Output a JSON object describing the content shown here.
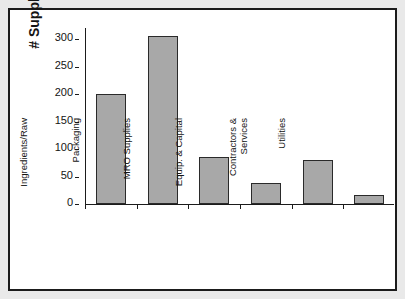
{
  "chart_data": {
    "type": "bar",
    "title": "",
    "xlabel": "",
    "ylabel": "# Suppliers",
    "ylim": [
      0,
      320
    ],
    "yticks": [
      0,
      50,
      100,
      150,
      200,
      250,
      300
    ],
    "ytick_labels": [
      "0",
      "50",
      "100",
      "150",
      "200",
      "250",
      "300"
    ],
    "grid": false,
    "legend": "none",
    "bar_color": "#a8a8a8",
    "bar_edge_color": "#2a2a2a",
    "axis_color": "#1b1b1b",
    "frame_color": "#1b1b1b",
    "background": "#ffffff",
    "categories": [
      "Ingredients/Raw",
      "Packaging",
      "MRO Supplies",
      "Equip. & Capital",
      "Contractors & Services",
      "Utilities"
    ],
    "category_lines": [
      [
        "Ingredients/Raw"
      ],
      [
        "Packaging"
      ],
      [
        "MRO Supplies"
      ],
      [
        "Equip. & Capital"
      ],
      [
        "Contractors &",
        "Services"
      ],
      [
        "Utilities"
      ]
    ],
    "values": [
      200,
      305,
      85,
      38,
      80,
      17
    ]
  }
}
